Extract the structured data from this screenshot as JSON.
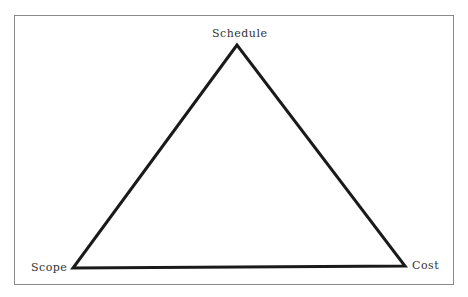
{
  "diagram": {
    "type": "triangle",
    "vertices": [
      {
        "id": "top",
        "label": "Schedule",
        "x": 237,
        "y": 45
      },
      {
        "id": "bottom-left",
        "label": "Scope",
        "x": 73,
        "y": 268
      },
      {
        "id": "bottom-right",
        "label": "Cost",
        "x": 405,
        "y": 266
      }
    ],
    "labels": {
      "top": "Schedule",
      "left": "Scope",
      "right": "Cost"
    },
    "colors": {
      "frame_border": "#8a8a8a",
      "triangle_stroke": "#1a1a1a",
      "label_text": "#333333",
      "background": "#ffffff"
    }
  }
}
